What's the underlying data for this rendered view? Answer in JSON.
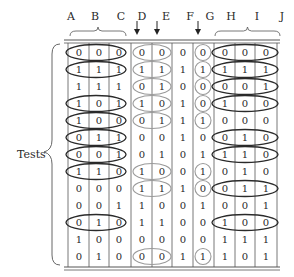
{
  "diagram": {
    "row_label": "Tests",
    "columns": [
      "A",
      "B",
      "C",
      "D",
      "E",
      "",
      "F",
      "G",
      "H",
      "I",
      "J"
    ],
    "column_headers": [
      {
        "label": "A",
        "x": 71
      },
      {
        "label": "B",
        "x": 95
      },
      {
        "label": "C",
        "x": 121
      },
      {
        "label": "D",
        "x": 142
      },
      {
        "label": "E",
        "x": 166
      },
      {
        "label": "F",
        "x": 190
      },
      {
        "label": "G",
        "x": 210
      },
      {
        "label": "H",
        "x": 231
      },
      {
        "label": "I",
        "x": 257
      },
      {
        "label": "J",
        "x": 282
      }
    ],
    "brace_groups": [
      {
        "name": "ABC",
        "columns": [
          "A",
          "B",
          "C"
        ]
      },
      {
        "name": "HIJ",
        "columns": [
          "H",
          "I",
          "J"
        ]
      }
    ],
    "arrows": [
      {
        "points_to": "column-D"
      },
      {
        "points_to": "column-E"
      },
      {
        "points_to": "column-F"
      }
    ],
    "rows": [
      {
        "values": [
          "0",
          "0",
          "0",
          "0",
          "0",
          "0",
          "0",
          "0",
          "0",
          "0"
        ],
        "circled": {
          "abc": true,
          "de": true,
          "f": true,
          "hij": true
        }
      },
      {
        "values": [
          "1",
          "1",
          "1",
          "1",
          "1",
          "1",
          "1",
          "1",
          "1",
          "1"
        ],
        "circled": {
          "abc": true,
          "de": true,
          "f": true,
          "hij": true
        }
      },
      {
        "values": [
          "1",
          "1",
          "1",
          "0",
          "1",
          "0",
          "0",
          "0",
          "0",
          "1"
        ],
        "circled": {
          "abc": false,
          "de": true,
          "f": true,
          "hij": true
        }
      },
      {
        "values": [
          "1",
          "0",
          "1",
          "1",
          "0",
          "1",
          "0",
          "1",
          "0",
          "0"
        ],
        "circled": {
          "abc": true,
          "de": true,
          "f": true,
          "hij": true
        }
      },
      {
        "values": [
          "1",
          "0",
          "0",
          "0",
          "1",
          "1",
          "1",
          "0",
          "0",
          "0"
        ],
        "circled": {
          "abc": true,
          "de": true,
          "f": true,
          "hij": false
        }
      },
      {
        "values": [
          "0",
          "1",
          "1",
          "0",
          "0",
          "1",
          "0",
          "0",
          "1",
          "0"
        ],
        "circled": {
          "abc": true,
          "de": false,
          "f": false,
          "hij": true
        }
      },
      {
        "values": [
          "0",
          "0",
          "1",
          "0",
          "1",
          "0",
          "1",
          "1",
          "1",
          "0"
        ],
        "circled": {
          "abc": true,
          "de": false,
          "f": false,
          "hij": true
        }
      },
      {
        "values": [
          "1",
          "1",
          "0",
          "1",
          "0",
          "0",
          "1",
          "0",
          "1",
          "0"
        ],
        "circled": {
          "abc": true,
          "de": true,
          "f": true,
          "hij": false
        }
      },
      {
        "values": [
          "0",
          "0",
          "0",
          "1",
          "1",
          "1",
          "0",
          "0",
          "1",
          "1"
        ],
        "circled": {
          "abc": false,
          "de": true,
          "f": true,
          "hij": true
        }
      },
      {
        "values": [
          "0",
          "0",
          "1",
          "1",
          "0",
          "0",
          "1",
          "0",
          "0",
          "1"
        ],
        "circled": {
          "abc": false,
          "de": false,
          "f": false,
          "hij": false
        }
      },
      {
        "values": [
          "0",
          "1",
          "0",
          "1",
          "1",
          "0",
          "0",
          "1",
          "0",
          "0"
        ],
        "circled": {
          "abc": true,
          "de": false,
          "f": false,
          "hij": true
        }
      },
      {
        "values": [
          "1",
          "0",
          "0",
          "0",
          "0",
          "0",
          "0",
          "1",
          "1",
          "1"
        ],
        "circled": {
          "abc": false,
          "de": false,
          "f": false,
          "hij": false
        }
      },
      {
        "values": [
          "0",
          "1",
          "0",
          "0",
          "0",
          "1",
          "1",
          "1",
          "0",
          "1"
        ],
        "circled": {
          "abc": false,
          "de": true,
          "f": true,
          "hij": false
        }
      }
    ]
  },
  "colors": {
    "dark_ellipse": "#2a2a2a",
    "light_ellipse": "#9a9a9a",
    "grid": "#555555"
  }
}
